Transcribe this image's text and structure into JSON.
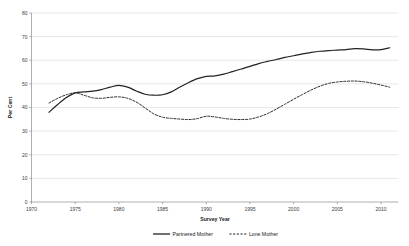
{
  "chart_data": {
    "type": "line",
    "title": "",
    "xlabel": "Survey Year",
    "ylabel": "Per Cent",
    "xlim": [
      1970,
      2012
    ],
    "ylim": [
      0,
      80
    ],
    "xticks": [
      1970,
      1975,
      1980,
      1985,
      1990,
      1995,
      2000,
      2005,
      2010
    ],
    "yticks": [
      0,
      10,
      20,
      30,
      40,
      50,
      60,
      70,
      80
    ],
    "grid": "horizontal",
    "legend_position": "bottom",
    "series": [
      {
        "name": "Partnered Mother",
        "style": "solid",
        "color": "#222222",
        "x": [
          1972,
          1973,
          1974,
          1975,
          1976,
          1977,
          1978,
          1979,
          1980,
          1981,
          1982,
          1983,
          1984,
          1985,
          1986,
          1987,
          1988,
          1989,
          1990,
          1991,
          1992,
          1993,
          1994,
          1995,
          1996,
          1997,
          1998,
          1999,
          2000,
          2001,
          2002,
          2003,
          2004,
          2005,
          2006,
          2007,
          2008,
          2009,
          2010,
          2011
        ],
        "values": [
          38.0,
          41.3,
          44.2,
          46.2,
          46.6,
          46.9,
          47.6,
          48.6,
          49.4,
          48.6,
          47.0,
          45.6,
          45.2,
          45.4,
          46.6,
          48.7,
          50.6,
          52.2,
          53.2,
          53.4,
          54.1,
          55.2,
          56.3,
          57.4,
          58.6,
          59.5,
          60.3,
          61.2,
          61.9,
          62.7,
          63.3,
          63.8,
          64.1,
          64.3,
          64.5,
          64.9,
          64.8,
          64.4,
          64.5,
          65.3
        ]
      },
      {
        "name": "Lone Mother",
        "style": "dashed",
        "color": "#2a2a2a",
        "x": [
          1972,
          1973,
          1974,
          1975,
          1976,
          1977,
          1978,
          1979,
          1980,
          1981,
          1982,
          1983,
          1984,
          1985,
          1986,
          1987,
          1988,
          1989,
          1990,
          1991,
          1992,
          1993,
          1994,
          1995,
          1996,
          1997,
          1998,
          1999,
          2000,
          2001,
          2002,
          2003,
          2004,
          2005,
          2006,
          2007,
          2008,
          2009,
          2010,
          2011
        ],
        "values": [
          41.9,
          43.9,
          45.4,
          46.2,
          45.2,
          44.1,
          43.9,
          44.3,
          44.5,
          43.9,
          42.3,
          39.8,
          37.3,
          35.9,
          35.4,
          35.1,
          34.9,
          35.3,
          36.3,
          36.0,
          35.4,
          35.0,
          34.9,
          35.1,
          36.0,
          37.4,
          39.3,
          41.4,
          43.5,
          45.5,
          47.4,
          49.0,
          50.2,
          50.8,
          51.1,
          51.2,
          50.9,
          50.3,
          49.5,
          48.6
        ]
      }
    ]
  },
  "legend": {
    "items": [
      {
        "label": "Partnered Mother",
        "style": "solid"
      },
      {
        "label": "Lone Mother",
        "style": "dashed"
      }
    ]
  },
  "axes": {
    "x_title": "Survey Year",
    "y_title": "Per Cent"
  }
}
